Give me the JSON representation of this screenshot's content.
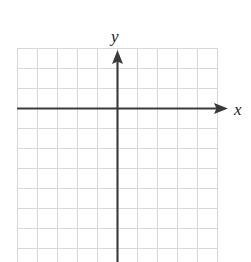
{
  "figure": {
    "kind": "blank-cartesian-grid",
    "background_color": "#ffffff",
    "grid": {
      "line_color": "#d8d8dc",
      "line_width": 1,
      "cell_size": 20,
      "left": 17,
      "top": 48,
      "right": 217,
      "bottom": 262,
      "columns": 10,
      "rows": 11,
      "visible": true
    },
    "axes": {
      "color": "#3a3a3c",
      "line_width": 2,
      "origin": {
        "x": 117,
        "y": 108
      },
      "x_axis": {
        "label": "x",
        "label_style": "italic",
        "label_x": 236,
        "label_y": 115,
        "start_x": 17,
        "end_x": 228,
        "y": 108,
        "arrow": "right"
      },
      "y_axis": {
        "label": "y",
        "label_style": "italic",
        "label_x": 117,
        "label_y": 38,
        "start_y": 262,
        "end_y": 50,
        "x": 117,
        "arrow": "up"
      }
    },
    "tick_labels": [],
    "plotted_series": [],
    "annotations": []
  },
  "header": {
    "cut_off_text": "",
    "note": "faint remnant of clipped text along the very top edge"
  }
}
